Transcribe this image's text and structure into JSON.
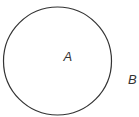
{
  "diagram": {
    "shapes": [
      {
        "type": "circle",
        "cx": 57.5,
        "cy": 61,
        "r": 54,
        "stroke": "#333333",
        "label": "A"
      }
    ],
    "labels": [
      {
        "text": "A",
        "x": 63.5,
        "y": 61,
        "position": "inside-circle"
      },
      {
        "text": "B",
        "x": 128,
        "y": 84,
        "position": "outside-circle"
      }
    ]
  }
}
